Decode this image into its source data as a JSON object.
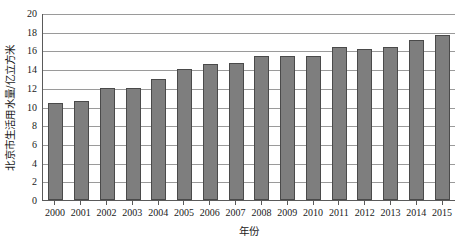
{
  "chart_data": {
    "type": "bar",
    "title": "",
    "subtitle": "",
    "xlabel": "年份",
    "ylabel": "北京市生活用水量/亿立方米",
    "categories": [
      "2000",
      "2001",
      "2002",
      "2003",
      "2004",
      "2005",
      "2006",
      "2007",
      "2008",
      "2009",
      "2010",
      "2011",
      "2012",
      "2013",
      "2014",
      "2015"
    ],
    "values": [
      10.4,
      10.55,
      12.0,
      11.95,
      12.9,
      14.05,
      14.5,
      14.65,
      15.4,
      15.4,
      15.35,
      16.4,
      16.1,
      16.35,
      17.1,
      17.6
    ],
    "series": [
      {
        "name": "北京市生活用水量",
        "values": [
          10.4,
          10.55,
          12.0,
          11.95,
          12.9,
          14.05,
          14.5,
          14.65,
          15.4,
          15.4,
          15.35,
          16.4,
          16.1,
          16.35,
          17.1,
          17.6
        ]
      }
    ],
    "ylim": [
      0,
      20
    ],
    "ytick_step": 2,
    "yticks": [
      0,
      2,
      4,
      6,
      8,
      10,
      12,
      14,
      16,
      18,
      20
    ],
    "ytick_labels": [
      "0",
      "2",
      "4",
      "6",
      "8",
      "10",
      "12",
      "14",
      "16",
      "18",
      "20"
    ],
    "grid": "horizontal",
    "legend": "none",
    "bar_color": "#7e7e7e",
    "bar_edge_color": "#4a4a4a",
    "gridline_color": "#9a9a9a",
    "axis_color": "#5a5a5a",
    "background": "#ffffff"
  }
}
